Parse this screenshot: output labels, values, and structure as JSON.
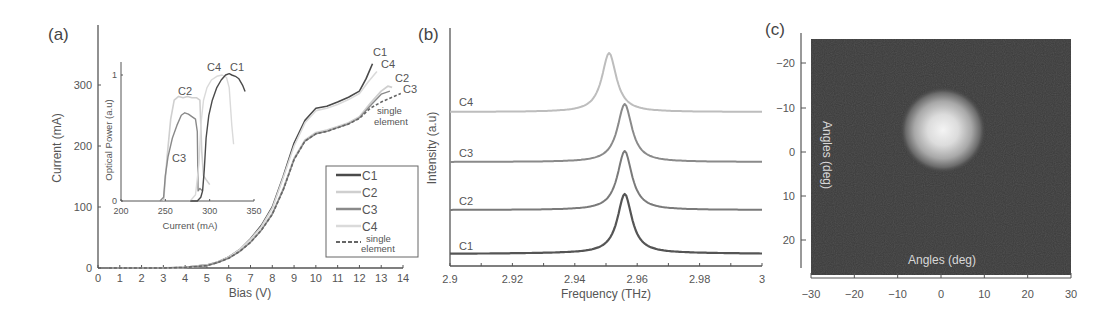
{
  "figure": {
    "panels": [
      {
        "id": "a",
        "label": "(a)"
      },
      {
        "id": "b",
        "label": "(b)"
      },
      {
        "id": "c",
        "label": "(c)"
      }
    ]
  },
  "colors": {
    "C1": "#4a4a4a",
    "C2": "#cfcfcf",
    "C3": "#8a8a8a",
    "C4": "#dadada",
    "single": "#666666",
    "axis": "#555555",
    "image_bg": "#3a3a3a"
  },
  "chart_data": [
    {
      "panel": "(a)",
      "type": "line",
      "xlabel": "Bias (V)",
      "ylabel": "Current (mA)",
      "xlim": [
        0,
        14
      ],
      "ylim": [
        0,
        370
      ],
      "xticks": [
        0,
        1,
        2,
        3,
        4,
        5,
        6,
        7,
        8,
        9,
        10,
        11,
        12,
        13,
        14
      ],
      "yticks": [
        0,
        100,
        200,
        300
      ],
      "legend": [
        "C1",
        "C2",
        "C3",
        "C4",
        "single element"
      ],
      "legend_position": "lower right",
      "series": [
        {
          "name": "C1",
          "x": [
            0.5,
            3,
            4,
            5,
            5.5,
            6,
            6.5,
            7,
            7.5,
            8,
            8.5,
            9,
            9.5,
            10,
            10.5,
            11,
            11.5,
            12,
            12.3,
            12.6
          ],
          "y": [
            0,
            0,
            1,
            5,
            10,
            18,
            30,
            48,
            70,
            100,
            150,
            205,
            242,
            262,
            265,
            272,
            280,
            290,
            310,
            335
          ]
        },
        {
          "name": "C4",
          "x": [
            0.5,
            3,
            4,
            5,
            5.5,
            6,
            6.5,
            7,
            7.5,
            8,
            8.5,
            9,
            9.5,
            10,
            10.5,
            11,
            11.5,
            12,
            12.4,
            12.8
          ],
          "y": [
            0,
            0,
            1,
            5,
            10,
            18,
            30,
            47,
            68,
            98,
            148,
            200,
            238,
            258,
            262,
            268,
            276,
            286,
            305,
            322
          ]
        },
        {
          "name": "C2",
          "x": [
            0.5,
            3,
            4,
            5,
            5.5,
            6,
            6.5,
            7,
            7.5,
            8,
            8.5,
            9,
            9.5,
            10,
            10.5,
            11,
            11.5,
            12,
            12.5,
            13,
            13.3,
            13.5
          ],
          "y": [
            0,
            0,
            1,
            4,
            9,
            16,
            27,
            43,
            63,
            90,
            130,
            180,
            210,
            222,
            226,
            232,
            238,
            248,
            270,
            290,
            298,
            296
          ]
        },
        {
          "name": "C3",
          "x": [
            0.5,
            3,
            4,
            5,
            5.5,
            6,
            6.5,
            7,
            7.5,
            8,
            8.5,
            9,
            9.5,
            10,
            10.5,
            11,
            11.5,
            12,
            12.5,
            13,
            13.4
          ],
          "y": [
            0,
            0,
            1,
            4,
            9,
            16,
            27,
            42,
            62,
            88,
            128,
            178,
            208,
            220,
            224,
            230,
            236,
            246,
            266,
            285,
            290
          ]
        },
        {
          "name": "single element",
          "x": [
            0.5,
            3,
            4,
            5,
            5.5,
            6,
            6.5,
            7,
            7.5,
            8,
            8.5,
            9,
            9.5,
            10,
            10.5,
            11,
            11.5,
            12,
            12.5,
            13,
            13.5,
            13.9
          ],
          "y": [
            0,
            0,
            1,
            4,
            9,
            16,
            27,
            42,
            62,
            88,
            128,
            178,
            208,
            220,
            224,
            230,
            236,
            245,
            262,
            272,
            280,
            286
          ]
        }
      ],
      "annotations": [
        "C1",
        "C4",
        "C2",
        "C3",
        "single element"
      ],
      "inset": {
        "type": "line",
        "xlabel": "Current (mA)",
        "ylabel": "Optical Power (a.u)",
        "xlim": [
          200,
          350
        ],
        "ylim": [
          0,
          1.1
        ],
        "xticks": [
          200,
          250,
          300,
          350
        ],
        "yticks": [
          0,
          1
        ],
        "series": [
          {
            "name": "C2",
            "x": [
              248,
              252,
              256,
              260,
              265,
              270,
              275,
              280,
              285,
              289,
              291,
              293,
              296,
              300
            ],
            "y": [
              0,
              0.35,
              0.65,
              0.8,
              0.83,
              0.82,
              0.83,
              0.82,
              0.82,
              0.8,
              0.4,
              0.2,
              0.17,
              0.13
            ]
          },
          {
            "name": "C3",
            "x": [
              244,
              248,
              250,
              253,
              258,
              263,
              268,
              272,
              276,
              280,
              284,
              286,
              287,
              289,
              292
            ],
            "y": [
              0,
              0.03,
              0.2,
              0.35,
              0.5,
              0.6,
              0.68,
              0.7,
              0.69,
              0.67,
              0.65,
              0.55,
              0.08,
              0.1,
              0.08
            ]
          },
          {
            "name": "C4",
            "x": [
              278,
              284,
              288,
              290,
              293,
              297,
              302,
              308,
              314,
              319,
              322,
              325,
              327
            ],
            "y": [
              0,
              0.05,
              0.3,
              0.6,
              0.8,
              0.9,
              0.96,
              0.99,
              1.0,
              0.98,
              0.9,
              0.6,
              0.45
            ]
          },
          {
            "name": "C1",
            "x": [
              278,
              286,
              290,
              292,
              294,
              296,
              299,
              303,
              308,
              313,
              318,
              322,
              325,
              329,
              333,
              337,
              340
            ],
            "y": [
              0,
              0,
              0.03,
              0.08,
              0.25,
              0.5,
              0.68,
              0.8,
              0.9,
              0.96,
              1.0,
              1.01,
              1.0,
              0.99,
              0.97,
              0.92,
              0.87
            ]
          }
        ],
        "annotations": [
          "C2",
          "C3",
          "C4",
          "C1"
        ]
      }
    },
    {
      "panel": "(b)",
      "type": "line",
      "xlabel": "Frequency (THz)",
      "ylabel": "Intensity (a.u)",
      "xlim": [
        2.9,
        3.0
      ],
      "xticks": [
        2.9,
        2.92,
        2.94,
        2.96,
        2.98,
        3
      ],
      "xtick_labels": [
        "2.9",
        "2.92",
        "2.94",
        "2.96",
        "2.98",
        "3"
      ],
      "series": [
        {
          "name": "C4",
          "peak_frequency": 2.951,
          "offset": 3,
          "relative_peak_height": 1.0
        },
        {
          "name": "C3",
          "peak_frequency": 2.956,
          "offset": 2,
          "relative_peak_height": 1.0
        },
        {
          "name": "C2",
          "peak_frequency": 2.956,
          "offset": 1,
          "relative_peak_height": 1.0
        },
        {
          "name": "C1",
          "peak_frequency": 2.956,
          "offset": 0,
          "relative_peak_height": 1.0
        }
      ],
      "note": "Stacked Lorentzian-like spectra, vertically offset"
    },
    {
      "panel": "(c)",
      "type": "heatmap",
      "xlabel": "Angles (deg)",
      "ylabel": "Angles (deg)",
      "xlim": [
        -30,
        30
      ],
      "ylim": [
        -27,
        27
      ],
      "xticks": [
        -30,
        -20,
        -10,
        0,
        10,
        20,
        30
      ],
      "yticks": [
        -20,
        -10,
        0,
        10,
        20
      ],
      "y_inverted": true,
      "beam_spot": {
        "center_x_deg": 0,
        "center_y_deg": -5,
        "radius_deg": 7
      },
      "note": "Far-field beam profile, bright spot on dark background"
    }
  ],
  "labels": {
    "a": {
      "xlabel": "Bias (V)",
      "ylabel": "Current (mA)",
      "xticks": [
        "0",
        "1",
        "2",
        "3",
        "4",
        "5",
        "6",
        "7",
        "8",
        "9",
        "10",
        "11",
        "12",
        "13",
        "14"
      ],
      "yticks": [
        "0",
        "100",
        "200",
        "300"
      ],
      "curve_labels": {
        "C1": "C1",
        "C4": "C4",
        "C2": "C2",
        "C3": "C3",
        "single1": "single",
        "single2": "element"
      },
      "legend": {
        "C1": "C1",
        "C2": "C2",
        "C3": "C3",
        "C4": "C4",
        "single1": "single",
        "single2": "element"
      },
      "inset": {
        "xlabel": "Current (mA)",
        "ylabel": "Optical Power (a.u)",
        "xticks": [
          "200",
          "250",
          "300",
          "350"
        ],
        "yticks": [
          "0",
          "1"
        ],
        "curve_labels": {
          "C2": "C2",
          "C3": "C3",
          "C4": "C4",
          "C1": "C1"
        }
      }
    },
    "b": {
      "xlabel": "Frequency (THz)",
      "ylabel": "Intensity (a.u)",
      "xticks": [
        "2.9",
        "2.92",
        "2.94",
        "2.96",
        "2.98",
        "3"
      ],
      "curve_labels": {
        "C4": "C4",
        "C3": "C3",
        "C2": "C2",
        "C1": "C1"
      }
    },
    "c": {
      "xlabel": "Angles (deg)",
      "ylabel": "Angles (deg)",
      "xticks": [
        "−30",
        "−20",
        "−10",
        "0",
        "10",
        "20",
        "30"
      ],
      "yticks": [
        "−20",
        "−10",
        "0",
        "10",
        "20"
      ]
    }
  }
}
